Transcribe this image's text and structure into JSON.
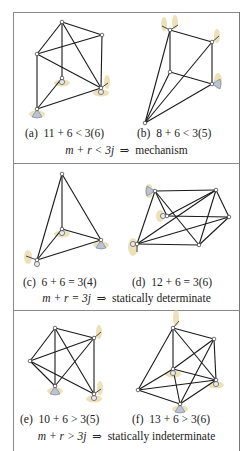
{
  "colors": {
    "member": "#1a1a1a",
    "joint_fill": "#ffffff",
    "joint_stroke": "#333333",
    "support_glow": "#e8d9a8",
    "support_body": "#b8c4d8",
    "border": "#8a8a8a"
  },
  "panels": [
    {
      "id": "mechanism",
      "condition_lhs": "m + r < 3j",
      "arrow": "⇒",
      "condition_result": "mechanism",
      "figures": [
        {
          "label": "(a)",
          "equation": "11 + 6 < 3(6)",
          "nodes": [
            [
              62,
              22
            ],
            [
              102,
              35
            ],
            [
              37,
              54
            ],
            [
              62,
              78
            ],
            [
              101,
              88
            ],
            [
              37,
              109
            ]
          ],
          "edges": [
            [
              0,
              1
            ],
            [
              0,
              2
            ],
            [
              0,
              3
            ],
            [
              0,
              4
            ],
            [
              2,
              1
            ],
            [
              2,
              4
            ],
            [
              2,
              5
            ],
            [
              1,
              4
            ],
            [
              3,
              5
            ],
            [
              5,
              4
            ]
          ],
          "supports": [
            {
              "node": 3,
              "type": "ball"
            },
            {
              "node": 4,
              "type": "ball-link"
            },
            {
              "node": 5,
              "type": "cone"
            }
          ]
        },
        {
          "label": "(b)",
          "equation": "8 + 6 < 3(5)",
          "nodes": [
            [
              170,
              30
            ],
            [
              212,
              42
            ],
            [
              170,
              72
            ],
            [
              212,
              84
            ],
            [
              145,
              123
            ]
          ],
          "edges": [
            [
              0,
              1
            ],
            [
              0,
              2
            ],
            [
              1,
              3
            ],
            [
              2,
              3
            ],
            [
              4,
              0
            ],
            [
              4,
              1
            ],
            [
              4,
              2
            ],
            [
              4,
              3
            ]
          ],
          "supports": [
            {
              "node": 0,
              "type": "double-link"
            },
            {
              "node": 1,
              "type": "link"
            },
            {
              "node": 3,
              "type": "cone-right"
            }
          ]
        }
      ]
    },
    {
      "id": "determinate",
      "condition_lhs": "m + r = 3j",
      "arrow": "⇒",
      "condition_result": "statically determinate",
      "figures": [
        {
          "label": "(c)",
          "equation": "6 + 6 = 3(4)",
          "nodes": [
            [
              62,
              174
            ],
            [
              62,
              229
            ],
            [
              101,
              240
            ],
            [
              37,
              260
            ]
          ],
          "edges": [
            [
              0,
              1
            ],
            [
              0,
              2
            ],
            [
              0,
              3
            ],
            [
              1,
              2
            ],
            [
              1,
              3
            ],
            [
              3,
              2
            ]
          ],
          "supports": [
            {
              "node": 1,
              "type": "ball"
            },
            {
              "node": 2,
              "type": "cone"
            },
            {
              "node": 3,
              "type": "ball-link-left"
            }
          ]
        },
        {
          "label": "(d)",
          "equation": "12 + 6 = 3(6)",
          "nodes": [
            [
              155,
              191
            ],
            [
              216,
              190
            ],
            [
              167,
              216
            ],
            [
              229,
              217
            ],
            [
              137,
              244
            ],
            [
              199,
              245
            ]
          ],
          "edges": [
            [
              0,
              1
            ],
            [
              0,
              2
            ],
            [
              0,
              4
            ],
            [
              0,
              5
            ],
            [
              1,
              2
            ],
            [
              1,
              3
            ],
            [
              1,
              4
            ],
            [
              1,
              5
            ],
            [
              2,
              3
            ],
            [
              3,
              4
            ],
            [
              3,
              5
            ],
            [
              4,
              5
            ]
          ],
          "supports": [
            {
              "node": 0,
              "type": "cone-left"
            },
            {
              "node": 2,
              "type": "ball-left"
            },
            {
              "node": 4,
              "type": "ball-link-down"
            }
          ]
        }
      ]
    },
    {
      "id": "indeterminate",
      "condition_lhs": "m + r > 3j",
      "arrow": "⇒",
      "condition_result": "statically indeterminate",
      "figures": [
        {
          "label": "(e)",
          "equation": "10 + 6 > 3(5)",
          "nodes": [
            [
              55,
              328
            ],
            [
              94,
              338
            ],
            [
              30,
              361
            ],
            [
              55,
              386
            ],
            [
              94,
              394
            ]
          ],
          "edges": [
            [
              0,
              1
            ],
            [
              0,
              2
            ],
            [
              0,
              3
            ],
            [
              0,
              4
            ],
            [
              1,
              2
            ],
            [
              1,
              3
            ],
            [
              1,
              4
            ],
            [
              2,
              3
            ],
            [
              2,
              4
            ]
          ],
          "supports": [
            {
              "node": 1,
              "type": "link"
            },
            {
              "node": 3,
              "type": "cone"
            },
            {
              "node": 4,
              "type": "ball-link"
            }
          ]
        },
        {
          "label": "(f)",
          "equation": "13 + 6 > 3(6)",
          "nodes": [
            [
              173,
              328
            ],
            [
              214,
              339
            ],
            [
              173,
              369
            ],
            [
              216,
              380
            ],
            [
              138,
              390
            ],
            [
              180,
              404
            ]
          ],
          "edges": [
            [
              0,
              1
            ],
            [
              0,
              2
            ],
            [
              0,
              4
            ],
            [
              0,
              3
            ],
            [
              1,
              2
            ],
            [
              1,
              3
            ],
            [
              1,
              5
            ],
            [
              2,
              4
            ],
            [
              2,
              3
            ],
            [
              2,
              5
            ],
            [
              4,
              3
            ],
            [
              4,
              5
            ],
            [
              3,
              5
            ]
          ],
          "supports": [
            {
              "node": 0,
              "type": "link-up"
            },
            {
              "node": 2,
              "type": "ball"
            },
            {
              "node": 3,
              "type": "ball"
            },
            {
              "node": 5,
              "type": "cone"
            }
          ]
        }
      ]
    }
  ]
}
